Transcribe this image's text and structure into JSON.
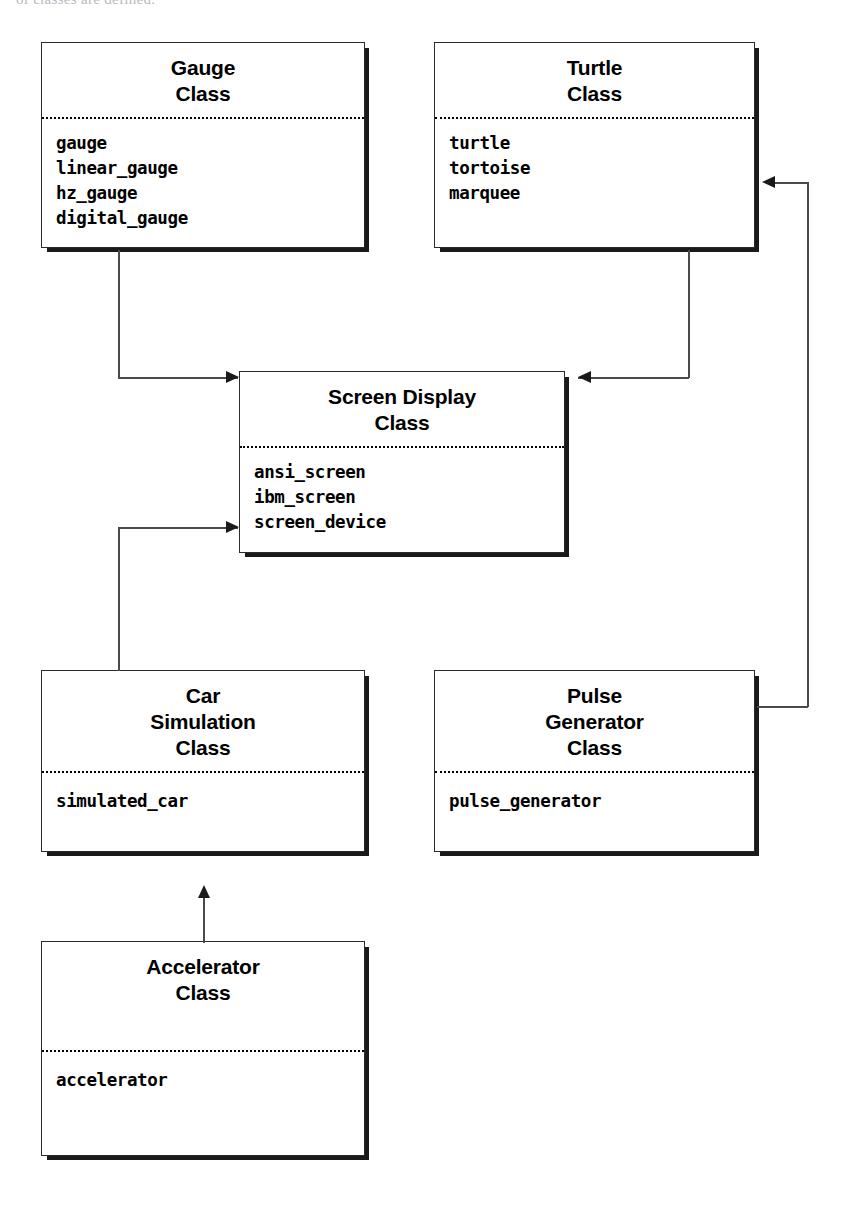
{
  "page": {
    "cut_off_header_text": "of classes are defined."
  },
  "diagram": {
    "type": "class-diagram",
    "colors": {
      "box_border": "#2b2b2b",
      "box_fill": "#ffffff",
      "shadow": "#1a1a1a",
      "connector": "#4a4a4a",
      "arrowhead": "#1a1a1a",
      "text": "#000000"
    },
    "boxes": [
      {
        "id": "gauge",
        "title_lines": [
          "Gauge",
          "Class"
        ],
        "members": [
          "gauge",
          "linear_gauge",
          "hz_gauge",
          "digital_gauge"
        ],
        "x": 41,
        "y": 42,
        "w": 324,
        "h": 206,
        "divider_y": 74
      },
      {
        "id": "turtle",
        "title_lines": [
          "Turtle",
          "Class"
        ],
        "members": [
          "turtle",
          "tortoise",
          "marquee"
        ],
        "x": 434,
        "y": 42,
        "w": 321,
        "h": 206,
        "divider_y": 74
      },
      {
        "id": "screen-display",
        "title_lines": [
          "Screen Display",
          "Class"
        ],
        "members": [
          "ansi_screen",
          "ibm_screen",
          "screen_device"
        ],
        "x": 239,
        "y": 371,
        "w": 326,
        "h": 182,
        "divider_y": 74
      },
      {
        "id": "car-simulation",
        "title_lines": [
          "Car",
          "Simulation",
          "Class"
        ],
        "members": [
          "simulated_car"
        ],
        "x": 41,
        "y": 670,
        "w": 324,
        "h": 182,
        "divider_y": 100
      },
      {
        "id": "pulse-generator",
        "title_lines": [
          "Pulse",
          "Generator",
          "Class"
        ],
        "members": [
          "pulse_generator"
        ],
        "x": 434,
        "y": 670,
        "w": 321,
        "h": 182,
        "divider_y": 100
      },
      {
        "id": "accelerator",
        "title_lines": [
          "Accelerator",
          "Class"
        ],
        "members": [
          "accelerator"
        ],
        "x": 41,
        "y": 941,
        "w": 324,
        "h": 215,
        "divider_y": 108
      }
    ],
    "connectors": [
      {
        "id": "gauge-to-screen-display",
        "from": "gauge",
        "to": "screen-display",
        "arrow": "right",
        "description": "Gauge Class bottom to Screen Display Class left"
      },
      {
        "id": "turtle-to-screen-display",
        "from": "turtle",
        "to": "screen-display",
        "arrow": "left",
        "description": "Turtle Class bottom to Screen Display Class right"
      },
      {
        "id": "car-simulation-to-screen-display",
        "from": "car-simulation",
        "to": "screen-display",
        "arrow": "right",
        "description": "Car Simulation Class top to Screen Display Class left"
      },
      {
        "id": "pulse-generator-to-turtle",
        "from": "pulse-generator",
        "to": "turtle",
        "arrow": "left",
        "description": "Pulse Generator Class right to Turtle Class right"
      },
      {
        "id": "accelerator-to-car-simulation",
        "from": "accelerator",
        "to": "car-simulation",
        "arrow": "up",
        "description": "Accelerator Class top to Car Simulation Class bottom"
      }
    ]
  }
}
